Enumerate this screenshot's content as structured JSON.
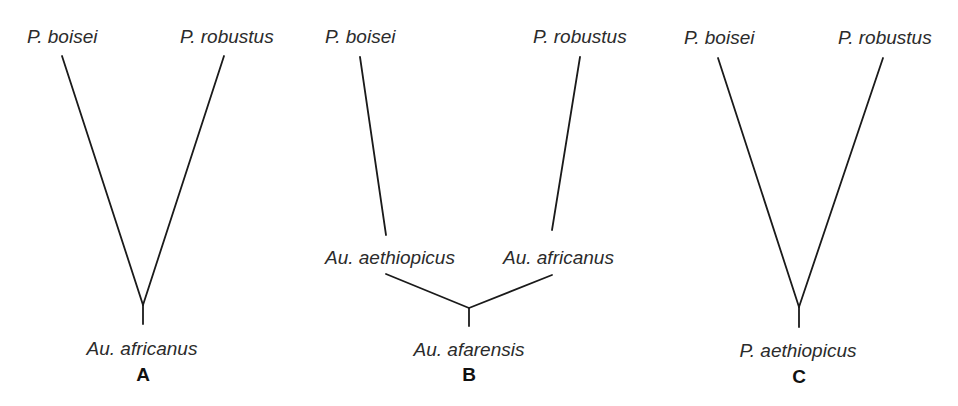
{
  "colors": {
    "line": "#1a1a1a",
    "text": "#2b2b2b",
    "background": "#ffffff"
  },
  "trees": [
    {
      "letter": "A",
      "top_left": "P. boisei",
      "top_right": "P. robustus",
      "root": "Au. africanus"
    },
    {
      "letter": "B",
      "top_left": "P. boisei",
      "top_right": "P. robustus",
      "mid_left": "Au. aethiopicus",
      "mid_right": "Au. africanus",
      "root": "Au. afarensis"
    },
    {
      "letter": "C",
      "top_left": "P. boisei",
      "top_right": "P. robustus",
      "root": "P. aethiopicus"
    }
  ]
}
